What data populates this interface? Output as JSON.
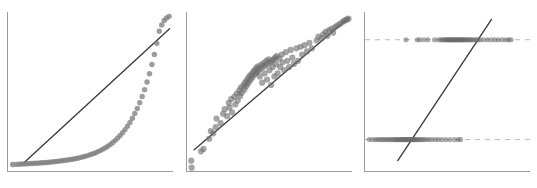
{
  "figure": {
    "width": 537,
    "height": 188,
    "background": "#ffffff",
    "panel_count": 3,
    "point_color": "#808080",
    "line_color": "#3a3a3a",
    "refline_color": "#b9b9b9",
    "spine_color": "#9b9b9b"
  },
  "chart_data": [
    {
      "id": "panel-1",
      "type": "scatter",
      "title": "",
      "xlabel": "",
      "ylabel": "",
      "grid": false,
      "legend": null,
      "xlim": [
        0,
        1
      ],
      "ylim": [
        0,
        1
      ],
      "description": "Quantile-quantile style scatter with convex upward-curving point cloud falling below an identity reference line, diverging sharply in the upper tail.",
      "series": [
        {
          "name": "points",
          "marker": "circle",
          "x": [
            0.022,
            0.044,
            0.062,
            0.078,
            0.094,
            0.11,
            0.126,
            0.142,
            0.157,
            0.172,
            0.187,
            0.202,
            0.217,
            0.232,
            0.247,
            0.262,
            0.277,
            0.292,
            0.307,
            0.322,
            0.337,
            0.352,
            0.367,
            0.382,
            0.397,
            0.412,
            0.427,
            0.442,
            0.457,
            0.472,
            0.487,
            0.502,
            0.517,
            0.532,
            0.547,
            0.562,
            0.577,
            0.592,
            0.607,
            0.622,
            0.637,
            0.652,
            0.667,
            0.682,
            0.697,
            0.712,
            0.727,
            0.742,
            0.757,
            0.772,
            0.787,
            0.802,
            0.817,
            0.832,
            0.847,
            0.862,
            0.877,
            0.892,
            0.907,
            0.922,
            0.937,
            0.952,
            0.967,
            0.982
          ],
          "y": [
            0.035,
            0.036,
            0.037,
            0.038,
            0.039,
            0.04,
            0.041,
            0.042,
            0.043,
            0.044,
            0.045,
            0.046,
            0.047,
            0.048,
            0.05,
            0.052,
            0.053,
            0.055,
            0.057,
            0.059,
            0.061,
            0.063,
            0.066,
            0.068,
            0.071,
            0.074,
            0.077,
            0.081,
            0.085,
            0.089,
            0.094,
            0.099,
            0.105,
            0.111,
            0.118,
            0.126,
            0.134,
            0.143,
            0.153,
            0.164,
            0.176,
            0.19,
            0.205,
            0.221,
            0.239,
            0.259,
            0.281,
            0.305,
            0.332,
            0.362,
            0.395,
            0.431,
            0.471,
            0.515,
            0.564,
            0.617,
            0.676,
            0.741,
            0.812,
            0.889,
            0.93,
            0.958,
            0.975,
            0.985
          ]
        }
      ],
      "reference_line": {
        "name": "identity-line",
        "style": "solid",
        "x": [
          0.08,
          0.985
        ],
        "y": [
          0.035,
          0.905
        ]
      }
    },
    {
      "id": "panel-2",
      "type": "scatter",
      "title": "",
      "xlabel": "",
      "ylabel": "",
      "grid": false,
      "legend": null,
      "xlim": [
        0,
        1
      ],
      "ylim": [
        0,
        1
      ],
      "description": "Scatter of observed versus fitted values tightly clustered around a diagonal identity line, with a dense cluster in the middle and two low outliers at bottom left.",
      "series": [
        {
          "name": "points",
          "marker": "circle",
          "x": [
            0.02,
            0.022,
            0.08,
            0.095,
            0.13,
            0.14,
            0.155,
            0.17,
            0.175,
            0.2,
            0.215,
            0.225,
            0.24,
            0.25,
            0.255,
            0.265,
            0.27,
            0.285,
            0.29,
            0.3,
            0.305,
            0.315,
            0.32,
            0.325,
            0.33,
            0.34,
            0.345,
            0.35,
            0.355,
            0.36,
            0.365,
            0.37,
            0.375,
            0.38,
            0.385,
            0.39,
            0.395,
            0.4,
            0.405,
            0.41,
            0.415,
            0.42,
            0.425,
            0.43,
            0.435,
            0.44,
            0.445,
            0.45,
            0.455,
            0.46,
            0.465,
            0.47,
            0.475,
            0.48,
            0.485,
            0.49,
            0.495,
            0.5,
            0.505,
            0.51,
            0.515,
            0.52,
            0.525,
            0.53,
            0.535,
            0.54,
            0.545,
            0.55,
            0.56,
            0.565,
            0.575,
            0.58,
            0.59,
            0.6,
            0.61,
            0.62,
            0.63,
            0.64,
            0.65,
            0.665,
            0.675,
            0.69,
            0.7,
            0.715,
            0.73,
            0.745,
            0.76,
            0.79,
            0.8,
            0.82,
            0.83,
            0.845,
            0.855,
            0.865,
            0.88,
            0.89,
            0.9,
            0.915,
            0.93,
            0.945,
            0.955,
            0.965,
            0.975,
            0.985
          ],
          "y": [
            0.06,
            0.015,
            0.12,
            0.135,
            0.2,
            0.25,
            0.235,
            0.275,
            0.33,
            0.3,
            0.36,
            0.39,
            0.345,
            0.43,
            0.4,
            0.455,
            0.37,
            0.47,
            0.42,
            0.49,
            0.445,
            0.51,
            0.475,
            0.53,
            0.495,
            0.545,
            0.515,
            0.56,
            0.535,
            0.575,
            0.55,
            0.59,
            0.565,
            0.605,
            0.58,
            0.615,
            0.595,
            0.63,
            0.61,
            0.64,
            0.62,
            0.655,
            0.63,
            0.665,
            0.64,
            0.6,
            0.65,
            0.675,
            0.56,
            0.66,
            0.685,
            0.62,
            0.67,
            0.7,
            0.58,
            0.68,
            0.71,
            0.64,
            0.69,
            0.545,
            0.7,
            0.66,
            0.71,
            0.6,
            0.72,
            0.68,
            0.73,
            0.62,
            0.715,
            0.66,
            0.74,
            0.69,
            0.64,
            0.755,
            0.7,
            0.66,
            0.77,
            0.72,
            0.68,
            0.78,
            0.7,
            0.79,
            0.74,
            0.8,
            0.76,
            0.815,
            0.78,
            0.83,
            0.855,
            0.845,
            0.87,
            0.885,
            0.86,
            0.895,
            0.905,
            0.88,
            0.915,
            0.925,
            0.935,
            0.945,
            0.955,
            0.96,
            0.965,
            0.97
          ]
        }
      ],
      "reference_line": {
        "name": "identity-line",
        "style": "solid",
        "x": [
          0.038,
          0.985
        ],
        "y": [
          0.13,
          0.975
        ]
      }
    },
    {
      "id": "panel-3",
      "type": "scatter",
      "title": "",
      "xlabel": "",
      "ylabel": "",
      "grid": false,
      "legend": null,
      "xlim": [
        0,
        1
      ],
      "ylim": [
        0,
        1
      ],
      "description": "Binary outcome plot: observations lie on two horizontal dashed reference lines (value 1 upper, value 0 lower) with a steep solid fitted line crossing between them.",
      "series": [
        {
          "name": "outcome-1",
          "marker": "circle",
          "y_level": 0.835,
          "x": [
            0.245,
            0.315,
            0.33,
            0.355,
            0.38,
            0.42,
            0.445,
            0.46,
            0.47,
            0.478,
            0.486,
            0.494,
            0.5,
            0.506,
            0.512,
            0.518,
            0.524,
            0.53,
            0.536,
            0.542,
            0.548,
            0.554,
            0.56,
            0.566,
            0.572,
            0.578,
            0.584,
            0.59,
            0.596,
            0.602,
            0.61,
            0.618,
            0.626,
            0.634,
            0.642,
            0.652,
            0.662,
            0.674,
            0.686,
            0.7,
            0.72,
            0.745,
            0.768,
            0.79,
            0.812,
            0.836,
            0.858,
            0.876,
            0.89
          ]
        },
        {
          "name": "outcome-0",
          "marker": "circle",
          "y_level": 0.195,
          "x": [
            0.02,
            0.04,
            0.058,
            0.072,
            0.086,
            0.098,
            0.11,
            0.122,
            0.134,
            0.146,
            0.156,
            0.166,
            0.176,
            0.184,
            0.192,
            0.2,
            0.208,
            0.216,
            0.222,
            0.228,
            0.234,
            0.24,
            0.246,
            0.252,
            0.258,
            0.264,
            0.27,
            0.276,
            0.282,
            0.288,
            0.294,
            0.3,
            0.308,
            0.316,
            0.324,
            0.334,
            0.344,
            0.356,
            0.37,
            0.386,
            0.404,
            0.424,
            0.444,
            0.466,
            0.49,
            0.516,
            0.544,
            0.566,
            0.58
          ]
        }
      ],
      "reference_lines": [
        {
          "name": "upper-reference-line",
          "style": "dashed",
          "y": 0.835,
          "x": [
            0.0,
            1.0
          ]
        },
        {
          "name": "lower-reference-line",
          "style": "dashed",
          "y": 0.195,
          "x": [
            0.0,
            1.0
          ]
        }
      ],
      "reference_line": {
        "name": "fitted-line",
        "style": "solid",
        "x": [
          0.195,
          0.77
        ],
        "y": [
          0.06,
          0.965
        ]
      }
    }
  ]
}
